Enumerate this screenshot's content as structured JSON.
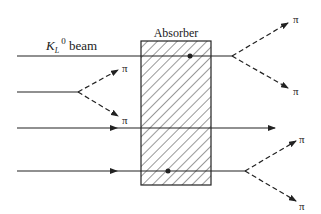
{
  "diagram": {
    "beam_label": "K",
    "beam_label_sub": "L",
    "beam_label_sup": "0",
    "beam_label_suffix": " beam",
    "absorber_label": "Absorber",
    "pion_label": "π",
    "colors": {
      "line": "#222222",
      "hatch": "#333333",
      "background": "#ffffff"
    }
  },
  "absorber": {
    "x": 141,
    "y": 41,
    "width": 70,
    "height": 144
  },
  "beams": [
    {
      "id": "beam1",
      "y": 56,
      "x_start": 17,
      "x_end": 232,
      "dot_x": 190,
      "decay": {
        "x": 232,
        "y": 56,
        "up": [
          290,
          22
        ],
        "down": [
          290,
          88
        ]
      }
    },
    {
      "id": "beam2",
      "y": 92,
      "x_start": 17,
      "x_end": 78,
      "decay": {
        "x": 78,
        "y": 92,
        "up": [
          118,
          70
        ],
        "down": [
          118,
          116
        ]
      }
    },
    {
      "id": "beam3",
      "y": 128,
      "x_start": 17,
      "x_end": 275,
      "arrow_x": 117
    },
    {
      "id": "beam4",
      "y": 171,
      "x_start": 17,
      "x_end": 245,
      "arrow_x": 117,
      "dot_x": 168,
      "decay": {
        "x": 245,
        "y": 171,
        "up": [
          297,
          140
        ],
        "down": [
          297,
          201
        ]
      }
    }
  ]
}
